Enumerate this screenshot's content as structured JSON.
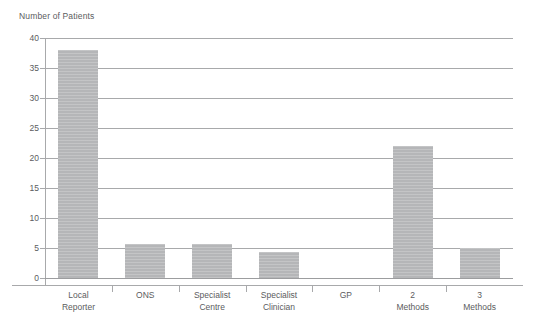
{
  "chart_data": {
    "type": "bar",
    "title": "",
    "ylabel": "Number of Patients",
    "xlabel": "",
    "ylim": [
      0,
      40
    ],
    "yticks": [
      0,
      5,
      10,
      15,
      20,
      25,
      30,
      35,
      40
    ],
    "grid": true,
    "legend": "none",
    "bar_color": "#b5b6b8",
    "categories": [
      "Local Reporter",
      "ONS",
      "Specialist Centre",
      "Specialist Clinician",
      "GP",
      "2 Methods",
      "3 Methods"
    ],
    "category_lines": [
      [
        "Local",
        "Reporter"
      ],
      [
        "ONS",
        ""
      ],
      [
        "Specialist",
        "Centre"
      ],
      [
        "Specialist",
        "Clinician"
      ],
      [
        "GP",
        ""
      ],
      [
        "2",
        "Methods"
      ],
      [
        "3",
        "Methods"
      ]
    ],
    "values": [
      38,
      5.6,
      5.6,
      4.3,
      0,
      22,
      5
    ]
  },
  "axis": {
    "y_title": "Number of Patients",
    "tick_labels": [
      "0",
      "5",
      "10",
      "15",
      "20",
      "25",
      "30",
      "35",
      "40"
    ]
  }
}
